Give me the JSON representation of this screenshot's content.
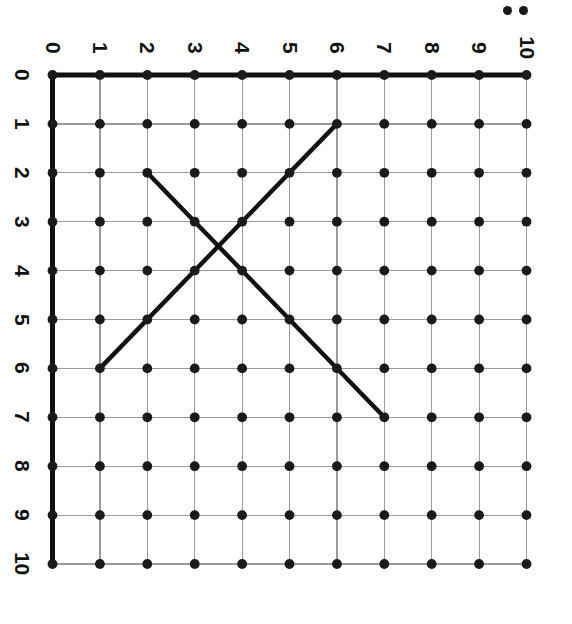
{
  "figure": {
    "kind": "coordinate-grid-lattice",
    "title": "",
    "orientation": "labels-rotated-90-clockwise",
    "background_color": "#ffffff",
    "axis_color": "#111111",
    "grid_color": "#9a9a9a",
    "dot_color": "#1a1a1a",
    "line_color": "#111111",
    "marker_colon": ":"
  },
  "axes": {
    "top": {
      "name": "column-axis",
      "min": 0,
      "max": 10,
      "ticks": [
        "0",
        "1",
        "2",
        "3",
        "4",
        "5",
        "6",
        "7",
        "8",
        "9",
        "10"
      ]
    },
    "left": {
      "name": "row-axis",
      "min": 0,
      "max": 10,
      "ticks": [
        "0",
        "1",
        "2",
        "3",
        "4",
        "5",
        "6",
        "7",
        "8",
        "9",
        "10"
      ]
    }
  },
  "chart_data": {
    "type": "scatter",
    "title": "",
    "xlabel": "",
    "ylabel": "",
    "xlim": [
      0,
      10
    ],
    "ylim": [
      0,
      10
    ],
    "grid": true,
    "legend": "none",
    "x_tick_labels": [
      "0",
      "1",
      "2",
      "3",
      "4",
      "5",
      "6",
      "7",
      "8",
      "9",
      "10"
    ],
    "y_tick_labels": [
      "0",
      "1",
      "2",
      "3",
      "4",
      "5",
      "6",
      "7",
      "8",
      "9",
      "10"
    ],
    "lattice_points": {
      "description": "11 by 11 array of filled round dots at every integer intersection",
      "count": 121,
      "x_values": [
        0,
        1,
        2,
        3,
        4,
        5,
        6,
        7,
        8,
        9,
        10
      ],
      "y_values": [
        0,
        1,
        2,
        3,
        4,
        5,
        6,
        7,
        8,
        9,
        10
      ]
    },
    "segments": [
      {
        "name": "ascending-segment",
        "from": [
          1,
          6
        ],
        "to": [
          6,
          1
        ],
        "slope": -1,
        "length_units": 5,
        "color": "#111111"
      },
      {
        "name": "descending-segment",
        "from": [
          2,
          2
        ],
        "to": [
          7,
          7
        ],
        "slope": 1,
        "length_units": 5,
        "color": "#111111"
      }
    ],
    "intersection": {
      "name": "segment-crossing",
      "point": [
        3.5,
        3.5
      ]
    }
  }
}
